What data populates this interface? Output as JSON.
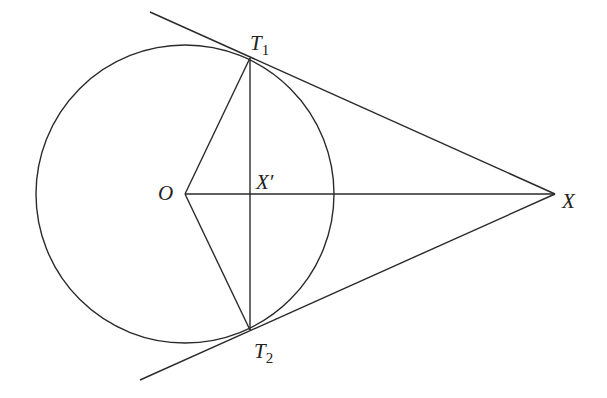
{
  "diagram": {
    "type": "geometry",
    "labels": {
      "O": "O",
      "X": "X",
      "X_prime": "X′",
      "T1_base": "T",
      "T1_sub": "1",
      "T2_base": "T",
      "T2_sub": "2"
    },
    "points": {
      "O": [
        185,
        194
      ],
      "X": [
        555,
        194
      ],
      "X_prime": [
        250,
        194
      ],
      "T1": [
        250,
        58
      ],
      "T2": [
        250,
        330
      ]
    },
    "circle": {
      "cx": 185,
      "cy": 194,
      "r": 149
    },
    "stroke_color": "#2a2a2a",
    "background": "#ffffff"
  }
}
